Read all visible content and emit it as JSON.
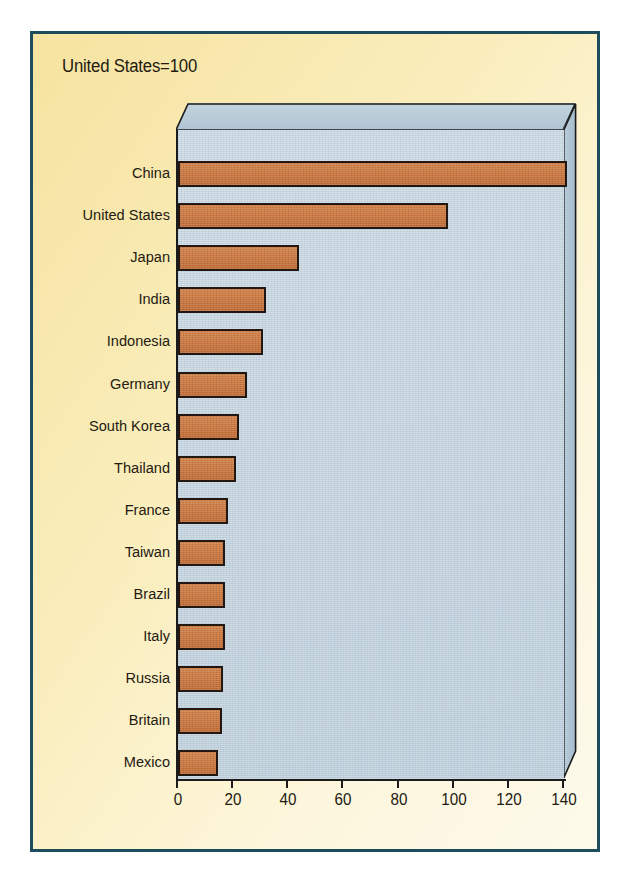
{
  "title": "United States=100",
  "colors": {
    "panel_border": "#1d4c5c",
    "panel_bg": "#f7e9b0",
    "bar_fill": "#c9763f",
    "bar_outline": "#231712",
    "plot_bg": "#c3d3de",
    "plot_top_face": "#b4c8d6",
    "plot_side_face": "#aec2d1",
    "text": "#241a11"
  },
  "chart_data": {
    "type": "bar",
    "orientation": "horizontal",
    "title": "United States=100",
    "xlabel": "",
    "ylabel": "",
    "xlim": [
      0,
      140
    ],
    "xticks": [
      0,
      20,
      40,
      60,
      80,
      100,
      120,
      140
    ],
    "xtick_labels": [
      "0",
      "20",
      "40",
      "60",
      "80",
      "100",
      "120",
      "140"
    ],
    "grid": false,
    "legend": false,
    "three_d": true,
    "categories": [
      "China",
      "United States",
      "Japan",
      "India",
      "Indonesia",
      "Germany",
      "South Korea",
      "Thailand",
      "France",
      "Taiwan",
      "Brazil",
      "Italy",
      "Russia",
      "Britain",
      "Mexico"
    ],
    "values": [
      141,
      98,
      44,
      32,
      31,
      25,
      22,
      21,
      18,
      17,
      17,
      17,
      16.5,
      16,
      14.5
    ],
    "series": [
      {
        "name": "Index (United States=100)",
        "values": [
          141,
          98,
          44,
          32,
          31,
          25,
          22,
          21,
          18,
          17,
          17,
          17,
          16.5,
          16,
          14.5
        ]
      }
    ]
  }
}
